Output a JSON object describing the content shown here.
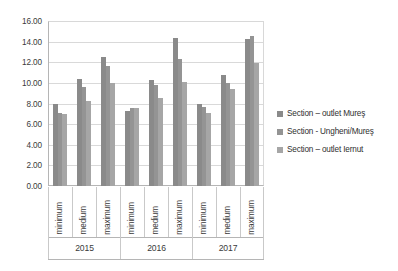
{
  "chart_data": {
    "type": "bar",
    "title": "",
    "subtitle": "",
    "xlabel": "",
    "ylabel": "",
    "ylim": [
      0,
      16
    ],
    "ytick_step": 2,
    "ytick_labels": [
      "16.00",
      "14.00",
      "12.00",
      "10.00",
      "8.00",
      "6.00",
      "4.00",
      "2.00",
      "0.00"
    ],
    "ytick_values": [
      16,
      14,
      12,
      10,
      8,
      6,
      4,
      2,
      0
    ],
    "grid": true,
    "legend_position": "right",
    "group_labels": [
      "2015",
      "2016",
      "2017"
    ],
    "categories": [
      "minimum",
      "medium",
      "maximum",
      "minimum",
      "medium",
      "maximum",
      "minimum",
      "medium",
      "maximum"
    ],
    "series": [
      {
        "name": "Section – outlet Mureş",
        "color": "#8a8a8a",
        "values": [
          8.0,
          10.4,
          12.55,
          7.3,
          10.25,
          14.4,
          8.0,
          10.75,
          14.3
        ]
      },
      {
        "name": "Section - Ungheni/Mureş",
        "color": "#949494",
        "values": [
          7.1,
          9.6,
          11.65,
          7.55,
          9.8,
          12.3,
          7.65,
          10.0,
          14.5
        ]
      },
      {
        "name": "Section – outlet Iernut",
        "color": "#a6a6a6",
        "values": [
          6.95,
          8.25,
          10.0,
          7.55,
          8.5,
          10.1,
          7.05,
          9.4,
          11.95
        ]
      }
    ]
  },
  "axis": {
    "y_labels": [
      "16.00",
      "14.00",
      "12.00",
      "10.00",
      "8.00",
      "6.00",
      "4.00",
      "2.00",
      "0.00"
    ],
    "x_categories": [
      "minimum",
      "medium",
      "maximum",
      "minimum",
      "medium",
      "maximum",
      "minimum",
      "medium",
      "maximum"
    ],
    "x_groups": [
      "2015",
      "2016",
      "2017"
    ]
  },
  "legend": {
    "items": [
      {
        "label": "Section – outlet Mureş",
        "color": "#8a8a8a"
      },
      {
        "label": "Section - Ungheni/Mureş",
        "color": "#949494"
      },
      {
        "label": "Section – outlet Iernut",
        "color": "#a6a6a6"
      }
    ]
  },
  "colors": {
    "background": "#ffffff",
    "gridline": "#d9d9d9",
    "axis": "#b5b5b5",
    "text": "#3a3a3a"
  }
}
